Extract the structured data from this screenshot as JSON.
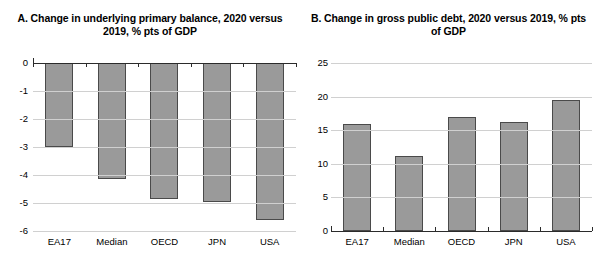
{
  "figure": {
    "background": "#ffffff",
    "bar_fill": "#9a9a9a",
    "bar_border": "#4a4a4a",
    "gridline_color": "#d0d0d0",
    "axis_color": "#2b2b2b"
  },
  "panels": [
    {
      "id": "A",
      "title": "A. Change  in underlying primary balance, 2020 versus 2019, % pts of GDP"
    },
    {
      "id": "B",
      "title": "B. Change in gross public debt, 2020 versus 2019, % pts of GDP"
    }
  ],
  "chart_data": [
    {
      "type": "bar",
      "panel": "A",
      "title": "A. Change  in underlying primary balance, 2020 versus 2019, % pts of GDP",
      "xlabel": "",
      "ylabel": "",
      "categories": [
        "EA17",
        "Median",
        "OECD",
        "JPN",
        "USA"
      ],
      "values": [
        -3.0,
        -4.15,
        -4.85,
        -4.95,
        -5.6
      ],
      "ylim": [
        -6,
        0
      ],
      "yticks": [
        0,
        -1,
        -2,
        -3,
        -4,
        -5,
        -6
      ],
      "ytick_labels": [
        "0",
        "-1",
        "-2",
        "-3",
        "-4",
        "-5",
        "-6"
      ],
      "grid": true,
      "legend": "none",
      "series_color": "#9a9a9a"
    },
    {
      "type": "bar",
      "panel": "B",
      "title": "B. Change in gross public debt, 2020 versus 2019, % pts of GDP",
      "xlabel": "",
      "ylabel": "",
      "categories": [
        "EA17",
        "Median",
        "OECD",
        "JPN",
        "USA"
      ],
      "values": [
        15.9,
        11.2,
        16.9,
        16.2,
        19.5
      ],
      "ylim": [
        0,
        25
      ],
      "yticks": [
        0,
        5,
        10,
        15,
        20,
        25
      ],
      "ytick_labels": [
        "0",
        "5",
        "10",
        "15",
        "20",
        "25"
      ],
      "grid": true,
      "legend": "none",
      "series_color": "#9a9a9a"
    }
  ]
}
